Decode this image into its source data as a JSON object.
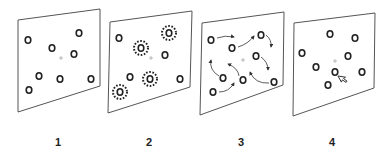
{
  "figure": {
    "panels": [
      {
        "label": "1",
        "stage": "display",
        "outline": [
          [
            18,
            20
          ],
          [
            100,
            9
          ],
          [
            100,
            86
          ],
          [
            18,
            112
          ]
        ],
        "fixation": [
          61,
          58
        ],
        "objects": [
          [
            28,
            40
          ],
          [
            79,
            33
          ],
          [
            52,
            48
          ],
          [
            74,
            54
          ],
          [
            39,
            76
          ],
          [
            60,
            79
          ],
          [
            91,
            79
          ],
          [
            29,
            90
          ]
        ],
        "cued": []
      },
      {
        "label": "2",
        "stage": "cue",
        "outline": [
          [
            110,
            22
          ],
          [
            192,
            11
          ],
          [
            190,
            87
          ],
          [
            108,
            113
          ]
        ],
        "fixation": [
          151,
          58
        ],
        "objects": [
          [
            119,
            38
          ],
          [
            165,
            55
          ],
          [
            130,
            77
          ],
          [
            180,
            79
          ]
        ],
        "cued": [
          [
            169,
            33
          ],
          [
            141,
            48
          ],
          [
            150,
            79
          ],
          [
            120,
            92
          ]
        ]
      },
      {
        "label": "3",
        "stage": "tracking",
        "outline": [
          [
            202,
            23
          ],
          [
            284,
            12
          ],
          [
            283,
            85
          ],
          [
            200,
            115
          ]
        ],
        "fixation": [
          243,
          60
        ],
        "objects": [
          [
            211,
            40
          ],
          [
            232,
            48
          ],
          [
            261,
            35
          ],
          [
            256,
            56
          ],
          [
            223,
            78
          ],
          [
            243,
            80
          ],
          [
            274,
            82
          ],
          [
            213,
            92
          ]
        ],
        "arrows": [
          "M217,38 Q225,35 234,37",
          "M238,47 Q248,44 254,36",
          "M266,35 Q272,40 271,47",
          "M261,57 Q268,62 268,70",
          "M219,76 Q209,70 211,60",
          "M239,76 Q238,68 228,64",
          "M269,83 Q255,84 250,72",
          "M219,92 Q229,92 234,83"
        ]
      },
      {
        "label": "4",
        "stage": "probe",
        "outline": [
          [
            294,
            23
          ],
          [
            375,
            13
          ],
          [
            374,
            88
          ],
          [
            293,
            116
          ]
        ],
        "fixation": [
          335,
          61
        ],
        "objects": [
          [
            330,
            34
          ],
          [
            355,
            38
          ],
          [
            302,
            53
          ],
          [
            316,
            67
          ],
          [
            348,
            56
          ],
          [
            335,
            72
          ],
          [
            362,
            72
          ],
          [
            328,
            85
          ]
        ],
        "cursor": [
          338,
          76
        ],
        "cursor_icon": "mouse-pointer-icon"
      }
    ],
    "colors": {
      "ink": "#222222",
      "outline": "#555555",
      "fixation": "#aaaaaa"
    }
  }
}
